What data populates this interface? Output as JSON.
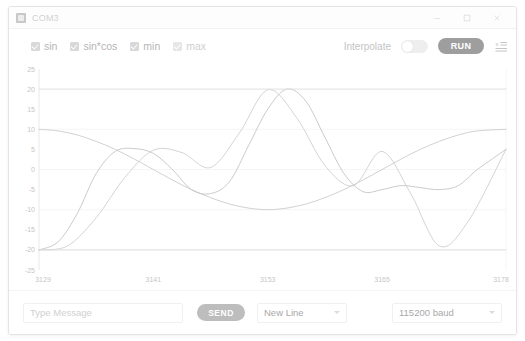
{
  "window": {
    "title": "COM3",
    "icon": "app-icon",
    "controls": [
      {
        "name": "minimize-button",
        "glyph": "minimize-icon"
      },
      {
        "name": "maximize-button",
        "glyph": "maximize-icon"
      },
      {
        "name": "close-button",
        "glyph": "close-icon"
      }
    ]
  },
  "toolbar": {
    "series_toggles": [
      {
        "label": "sin",
        "checked": true,
        "dim": false
      },
      {
        "label": "sin*cos",
        "checked": true,
        "dim": false
      },
      {
        "label": "min",
        "checked": true,
        "dim": false
      },
      {
        "label": "max",
        "checked": true,
        "dim": true
      }
    ],
    "interpolate_label": "Interpolate",
    "interpolate_on": false,
    "run_label": "RUN",
    "legend_icon": "axis-legend-icon"
  },
  "chart_data": {
    "type": "line",
    "title": "",
    "xlabel": "",
    "ylabel": "",
    "grid": true,
    "legend_position": "top-left",
    "xlim": [
      3129,
      3178
    ],
    "ylim": [
      -25,
      25
    ],
    "ytick_labels": [
      "25",
      "20",
      "15",
      "10",
      "5",
      "0",
      "-5",
      "-10",
      "-15",
      "-20",
      "-25"
    ],
    "ytick_values": [
      25,
      20,
      15,
      10,
      5,
      0,
      -5,
      -10,
      -15,
      -20,
      -25
    ],
    "xtick_labels": [
      "3129",
      "3141",
      "3153",
      "3165",
      "3178"
    ],
    "xtick_values": [
      3129,
      3141,
      3153,
      3165,
      3178
    ],
    "series": [
      {
        "name": "sin",
        "color": "#c9c9c9",
        "x": [
          3129,
          3131,
          3133,
          3135,
          3137,
          3139,
          3141,
          3143,
          3145,
          3147,
          3149,
          3151,
          3153,
          3155,
          3157,
          3159,
          3161,
          3163,
          3165,
          3167,
          3169,
          3171,
          3173,
          3175,
          3178
        ],
        "y": [
          10.0,
          9.6,
          8.6,
          7.0,
          5.0,
          2.6,
          0.0,
          -2.6,
          -5.0,
          -7.0,
          -8.6,
          -9.6,
          -10.0,
          -9.6,
          -8.6,
          -7.0,
          -5.0,
          -2.6,
          0.0,
          2.6,
          5.0,
          7.0,
          8.6,
          9.6,
          10.0
        ]
      },
      {
        "name": "sin*cos",
        "color": "#c2c2c2",
        "x": [
          3129,
          3131,
          3133,
          3135,
          3137,
          3139,
          3141,
          3143,
          3145,
          3147,
          3149,
          3151,
          3153,
          3155,
          3157,
          3159,
          3161,
          3163,
          3165,
          3167,
          3169,
          3171,
          3173,
          3175,
          3178
        ],
        "y": [
          -20.0,
          -18.0,
          -11.0,
          -1.0,
          4.5,
          5.2,
          4.0,
          0.0,
          -5.0,
          -6.0,
          -3.0,
          6.0,
          15.0,
          20.0,
          17.0,
          8.0,
          -1.0,
          -5.5,
          -5.0,
          -4.0,
          -4.5,
          -5.0,
          -4.0,
          0.0,
          5.0
        ]
      },
      {
        "name": "wave",
        "color": "#cccccc",
        "x": [
          3129,
          3132,
          3135,
          3138,
          3141,
          3144,
          3147,
          3150,
          3153,
          3156,
          3159,
          3162,
          3165,
          3168,
          3171,
          3174,
          3178
        ],
        "y": [
          -20.0,
          -19.0,
          -12.0,
          -2.0,
          4.8,
          4.2,
          0.5,
          9.0,
          19.8,
          13.0,
          1.0,
          -4.0,
          4.5,
          -6.0,
          -19.0,
          -13.0,
          5.0
        ]
      },
      {
        "name": "max",
        "color": "#e2e2e2",
        "x": [
          3129,
          3178
        ],
        "y": [
          20,
          20
        ]
      },
      {
        "name": "min",
        "color": "#dcdcdc",
        "x": [
          3129,
          3178
        ],
        "y": [
          -20,
          -20
        ]
      }
    ]
  },
  "bottom": {
    "message_placeholder": "Type Message",
    "message_value": "",
    "send_label": "SEND",
    "line_ending": "New Line",
    "baud_rate": "115200 baud"
  }
}
